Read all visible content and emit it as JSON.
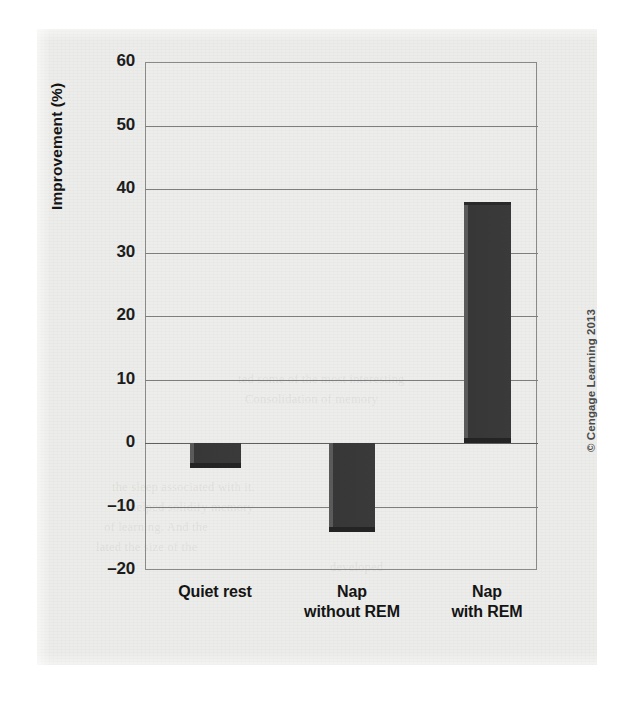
{
  "chart_data": {
    "type": "bar",
    "title": "",
    "xlabel": "",
    "ylabel": "Improvement (%)",
    "categories": [
      "Quiet rest",
      "Nap without REM",
      "Nap with REM"
    ],
    "category_lines": [
      [
        "Quiet rest"
      ],
      [
        "Nap",
        "without REM"
      ],
      [
        "Nap",
        "with REM"
      ]
    ],
    "values": [
      -4,
      -14,
      38
    ],
    "ylim": [
      -20,
      60
    ],
    "ytick_labels": [
      "60",
      "50",
      "40",
      "30",
      "20",
      "10",
      "0",
      "–10",
      "–20"
    ],
    "ytick_values": [
      60,
      50,
      40,
      30,
      20,
      10,
      0,
      -10,
      -20
    ],
    "grid": true,
    "legend": null,
    "bar_color": "#3a3a3a",
    "grid_color": "#7e7e7e",
    "plot_bg": "#ececea"
  },
  "credit": {
    "text": "© Cengage Learning 2013"
  },
  "bleed_through": [
    {
      "text": "ted some of the most interesting",
      "x": 238,
      "y": 372
    },
    {
      "text": "Consolidation of memory",
      "x": 245,
      "y": 392
    },
    {
      "text": "the sleep associated with it.",
      "x": 112,
      "y": 480
    },
    {
      "text": "helped solidify memory",
      "x": 130,
      "y": 500
    },
    {
      "text": "of learning. And the",
      "x": 104,
      "y": 520
    },
    {
      "text": "lated the size of the",
      "x": 96,
      "y": 540
    },
    {
      "text": "developed",
      "x": 330,
      "y": 560
    }
  ]
}
